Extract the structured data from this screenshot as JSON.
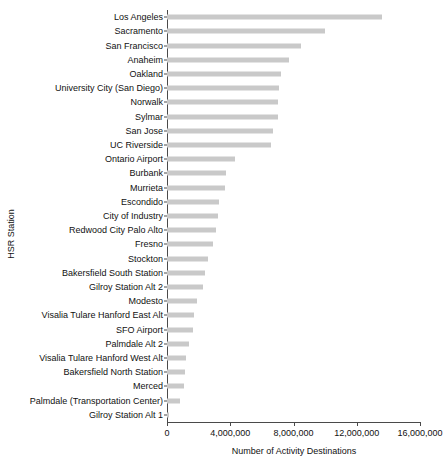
{
  "chart_data": {
    "type": "bar",
    "orientation": "horizontal",
    "title": "",
    "xlabel": "Number of Activity Destinations",
    "ylabel": "HSR Station",
    "xlim": [
      0,
      16000000
    ],
    "xticks": [
      0,
      4000000,
      8000000,
      12000000,
      16000000
    ],
    "xtick_labels": [
      "0",
      "4,000,000",
      "8,000,000",
      "12,000,000",
      "16,000,000"
    ],
    "grid": false,
    "legend": false,
    "bar_color": "#c9c9c9",
    "axis_color": "#4a4a4a",
    "categories": [
      "Los Angeles",
      "Sacramento",
      "San Francisco",
      "Anaheim",
      "Oakland",
      "University City (San Diego)",
      "Norwalk",
      "Sylmar",
      "San Jose",
      "UC Riverside",
      "Ontario Airport",
      "Burbank",
      "Murrieta",
      "Escondido",
      "City of Industry",
      "Redwood City Palo Alto",
      "Fresno",
      "Stockton",
      "Bakersfield South Station",
      "Gilroy Station Alt 2",
      "Modesto",
      "Visalia Tulare Hanford East Alt",
      "SFO Airport",
      "Palmdale Alt 2",
      "Visalia Tulare Hanford West Alt",
      "Bakersfield North Station",
      "Merced",
      "Palmdale (Transportation Center)",
      "Gilroy Station Alt 1"
    ],
    "values": [
      13600000,
      10000000,
      8500000,
      7700000,
      7200000,
      7100000,
      7050000,
      7000000,
      6700000,
      6600000,
      4300000,
      3700000,
      3650000,
      3300000,
      3200000,
      3100000,
      2900000,
      2600000,
      2400000,
      2300000,
      1900000,
      1700000,
      1650000,
      1400000,
      1200000,
      1150000,
      1050000,
      800000,
      150000
    ]
  }
}
